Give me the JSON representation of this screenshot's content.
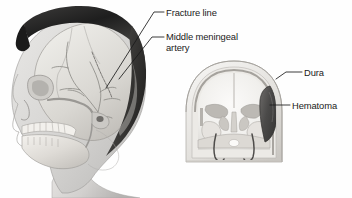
{
  "figure": {
    "background_color": "#fefefe",
    "text_color": "#1a1a1a",
    "leader_line_color": "#1a1a1a"
  },
  "labels": [
    {
      "id": "fracture-line",
      "text": "Fracture line",
      "x": 166,
      "y": 7
    },
    {
      "id": "middle-meningeal-artery",
      "line1": "Middle meningeal",
      "line2": "artery",
      "x": 166,
      "y": 31
    },
    {
      "id": "dura",
      "text": "Dura",
      "x": 304,
      "y": 67
    },
    {
      "id": "hematoma",
      "text": "Hematoma",
      "x": 292,
      "y": 100
    }
  ],
  "illustrations": {
    "lateral_head": {
      "name": "lateral-head-skull-view",
      "hair_color": "#2b2b2b",
      "skin_color": "#d8d8d8",
      "bone_color": "#e8e6e3"
    },
    "coronal_section": {
      "name": "coronal-skull-section-view",
      "hematoma_color": "#555555",
      "dura_color": "#9a9a9a",
      "brain_color": "#f2f1ef"
    }
  }
}
